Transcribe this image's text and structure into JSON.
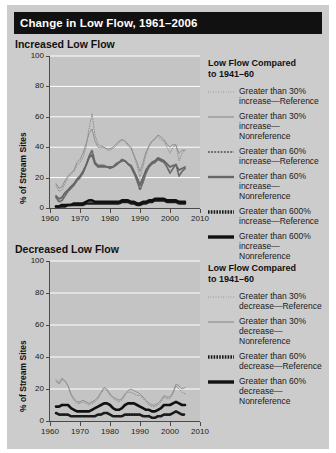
{
  "title": "Change in Low Flow, 1961–2006",
  "panels": [
    {
      "id": "top",
      "subtitle": "Increased Low Flow",
      "legend_title_l1": "Low Flow Compared",
      "legend_title_l2": "to 1941–60",
      "legend": [
        {
          "style": "dotted-thin",
          "l1": "Greater than 30%",
          "l2": "increase—Reference"
        },
        {
          "style": "solid-thin",
          "l1": "Greater than 30%",
          "l2": "increase—Nonreference"
        },
        {
          "style": "dotted-med",
          "l1": "Greater than 60%",
          "l2": "increase—Reference"
        },
        {
          "style": "solid-med",
          "l1": "Greater than 60%",
          "l2": "increase—Nonreference"
        },
        {
          "style": "dotted-thick",
          "l1": "Greater than 600%",
          "l2": "increase—Reference"
        },
        {
          "style": "solid-thick",
          "l1": "Greater than 600%",
          "l2": "increase—Nonreference"
        }
      ]
    },
    {
      "id": "bot",
      "subtitle": "Decreased Low Flow",
      "legend_title_l1": "Low Flow Compared",
      "legend_title_l2": "to 1941–60",
      "legend": [
        {
          "style": "dotted-thin",
          "l1": "Greater than 30%",
          "l2": "decrease—Reference"
        },
        {
          "style": "solid-thin",
          "l1": "Greater than 30%",
          "l2": "decrease—Nonreference"
        },
        {
          "style": "dotted-thick",
          "l1": "Greater than 60%",
          "l2": "decrease—Reference"
        },
        {
          "style": "solid-thick",
          "l1": "Greater than 60%",
          "l2": "decrease—Nonreference"
        }
      ]
    }
  ],
  "chart_data": [
    {
      "type": "line",
      "title": "Increased Low Flow",
      "xlabel": "",
      "ylabel": "% of Stream Sites",
      "xlim": [
        1960,
        2010
      ],
      "ylim": [
        0,
        100
      ],
      "xticks": [
        1960,
        1970,
        1980,
        1990,
        2000,
        2010
      ],
      "yticks": [
        0,
        20,
        40,
        60,
        80,
        100
      ],
      "grid": "horizontal",
      "legend_position": "right",
      "x": [
        1962,
        1963,
        1964,
        1965,
        1966,
        1967,
        1968,
        1969,
        1970,
        1971,
        1972,
        1973,
        1974,
        1975,
        1976,
        1977,
        1978,
        1979,
        1980,
        1981,
        1982,
        1983,
        1984,
        1985,
        1986,
        1987,
        1988,
        1989,
        1990,
        1991,
        1992,
        1993,
        1994,
        1995,
        1996,
        1997,
        1998,
        1999,
        2000,
        2001,
        2002,
        2003,
        2004,
        2005
      ],
      "series": [
        {
          "name": "Greater than 30% increase—Reference",
          "style": "dotted-thin",
          "values": [
            15,
            11,
            12,
            16,
            20,
            22,
            24,
            28,
            30,
            33,
            40,
            52,
            62,
            48,
            42,
            41,
            40,
            38,
            38,
            39,
            41,
            43,
            45,
            44,
            41,
            39,
            34,
            28,
            20,
            27,
            35,
            40,
            44,
            45,
            47,
            45,
            44,
            40,
            36,
            40,
            42,
            31,
            36,
            38
          ]
        },
        {
          "name": "Greater than 30% increase—Nonreference",
          "style": "solid-thin",
          "values": [
            16,
            13,
            14,
            18,
            21,
            23,
            25,
            30,
            32,
            36,
            42,
            49,
            52,
            44,
            40,
            40,
            40,
            39,
            39,
            40,
            42,
            44,
            45,
            44,
            42,
            40,
            35,
            30,
            24,
            30,
            37,
            41,
            44,
            46,
            48,
            47,
            45,
            42,
            40,
            42,
            41,
            36,
            38,
            38
          ]
        },
        {
          "name": "Greater than 60% increase—Reference",
          "style": "dotted-med",
          "values": [
            7,
            4,
            5,
            8,
            11,
            13,
            15,
            18,
            20,
            23,
            28,
            34,
            38,
            30,
            28,
            28,
            28,
            27,
            26,
            27,
            28,
            30,
            32,
            31,
            29,
            27,
            23,
            18,
            12,
            17,
            23,
            27,
            29,
            30,
            32,
            31,
            30,
            27,
            23,
            26,
            29,
            21,
            24,
            26
          ]
        },
        {
          "name": "Greater than 60% increase—Nonreference",
          "style": "solid-med",
          "values": [
            8,
            6,
            7,
            10,
            12,
            14,
            16,
            19,
            21,
            24,
            28,
            33,
            35,
            29,
            27,
            27,
            27,
            27,
            27,
            27,
            29,
            30,
            31,
            31,
            29,
            28,
            24,
            20,
            15,
            20,
            25,
            28,
            30,
            31,
            33,
            32,
            31,
            29,
            27,
            28,
            28,
            25,
            26,
            27
          ]
        },
        {
          "name": "Greater than 600% increase—Reference",
          "style": "dotted-thick",
          "values": [
            1,
            1,
            1,
            1,
            2,
            2,
            2,
            2,
            2,
            2,
            3,
            3,
            3,
            3,
            3,
            3,
            3,
            3,
            3,
            3,
            3,
            3,
            4,
            4,
            4,
            3,
            3,
            2,
            2,
            3,
            3,
            4,
            4,
            5,
            5,
            5,
            5,
            4,
            4,
            4,
            4,
            3,
            3,
            3
          ]
        },
        {
          "name": "Greater than 600% increase—Nonreference",
          "style": "solid-thick",
          "values": [
            1,
            1,
            2,
            2,
            2,
            2,
            3,
            3,
            3,
            3,
            4,
            5,
            5,
            4,
            4,
            4,
            4,
            4,
            4,
            4,
            4,
            4,
            5,
            5,
            5,
            4,
            4,
            3,
            3,
            4,
            4,
            5,
            5,
            6,
            6,
            6,
            6,
            5,
            5,
            5,
            5,
            4,
            4,
            4
          ]
        }
      ]
    },
    {
      "type": "line",
      "title": "Decreased Low Flow",
      "xlabel": "",
      "ylabel": "% of Stream Sites",
      "xlim": [
        1960,
        2010
      ],
      "ylim": [
        0,
        100
      ],
      "xticks": [
        1960,
        1970,
        1980,
        1990,
        2000,
        2010
      ],
      "yticks": [
        0,
        20,
        40,
        60,
        80,
        100
      ],
      "grid": "horizontal",
      "legend_position": "right",
      "x": [
        1962,
        1963,
        1964,
        1965,
        1966,
        1967,
        1968,
        1969,
        1970,
        1971,
        1972,
        1973,
        1974,
        1975,
        1976,
        1977,
        1978,
        1979,
        1980,
        1981,
        1982,
        1983,
        1984,
        1985,
        1986,
        1987,
        1988,
        1989,
        1990,
        1991,
        1992,
        1993,
        1994,
        1995,
        1996,
        1997,
        1998,
        1999,
        2000,
        2001,
        2002,
        2003,
        2004,
        2005
      ],
      "series": [
        {
          "name": "Greater than 30% decrease—Reference",
          "style": "dotted-thin",
          "values": [
            26,
            24,
            27,
            25,
            22,
            16,
            13,
            11,
            11,
            12,
            11,
            10,
            11,
            12,
            14,
            17,
            20,
            19,
            16,
            14,
            13,
            12,
            13,
            16,
            18,
            18,
            17,
            16,
            16,
            14,
            12,
            10,
            9,
            9,
            10,
            12,
            15,
            14,
            14,
            17,
            22,
            20,
            18,
            17
          ]
        },
        {
          "name": "Greater than 30% decrease—Nonreference",
          "style": "solid-thin",
          "values": [
            25,
            23,
            26,
            25,
            22,
            17,
            14,
            12,
            12,
            13,
            12,
            11,
            12,
            13,
            15,
            18,
            21,
            20,
            17,
            15,
            14,
            13,
            14,
            17,
            19,
            20,
            19,
            18,
            17,
            15,
            13,
            11,
            10,
            10,
            11,
            13,
            16,
            15,
            15,
            18,
            23,
            22,
            20,
            21
          ]
        },
        {
          "name": "Greater than 60% decrease—Reference",
          "style": "dotted-thick",
          "values": [
            5,
            4,
            4,
            4,
            4,
            3,
            3,
            3,
            3,
            3,
            3,
            3,
            3,
            3,
            4,
            4,
            5,
            5,
            4,
            3,
            3,
            3,
            3,
            4,
            4,
            4,
            4,
            4,
            4,
            3,
            3,
            3,
            2,
            2,
            3,
            3,
            4,
            4,
            4,
            5,
            6,
            5,
            4,
            4
          ]
        },
        {
          "name": "Greater than 60% decrease—Nonreference",
          "style": "solid-thick",
          "values": [
            9,
            9,
            10,
            10,
            10,
            8,
            7,
            6,
            6,
            6,
            6,
            6,
            7,
            8,
            9,
            10,
            11,
            11,
            10,
            8,
            7,
            7,
            8,
            10,
            11,
            11,
            11,
            10,
            9,
            8,
            7,
            7,
            6,
            6,
            7,
            8,
            10,
            10,
            10,
            11,
            12,
            11,
            10,
            10
          ]
        }
      ]
    }
  ]
}
